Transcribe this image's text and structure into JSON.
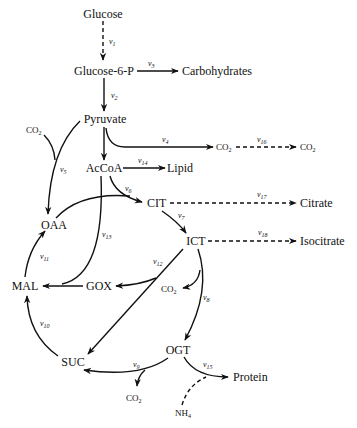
{
  "diagram": {
    "type": "metabolic-pathway",
    "nodes": {
      "glucose": "Glucose",
      "g6p": "Glucose-6-P",
      "carbohydrates": "Carbohydrates",
      "pyruvate": "Pyruvate",
      "co2_left": "CO",
      "acoa": "AcCoA",
      "lipid": "Lipid",
      "co2_v4": "CO",
      "co2_v16": "CO",
      "cit": "CIT",
      "citrate": "Citrate",
      "oaa": "OAA",
      "ict": "ICT",
      "isocitrate": "Isocitrate",
      "mal": "MAL",
      "gox": "GOX",
      "co2_ict": "CO",
      "suc": "SUC",
      "ogt": "OGT",
      "protein": "Protein",
      "co2_v9": "CO",
      "nh4": "NH"
    },
    "subscripts": {
      "co2": "2",
      "nh4": "4"
    },
    "fluxes": {
      "v1": "1",
      "v2": "2",
      "v3": "3",
      "v4": "4",
      "v5": "5",
      "v6": "6",
      "v7": "7",
      "v8": "8",
      "v9": "9",
      "v10": "10",
      "v11": "11",
      "v12": "12",
      "v13": "13",
      "v14": "14",
      "v15": "15",
      "v16": "16",
      "v17": "17",
      "v18": "18"
    },
    "flux_symbol": "v",
    "edges": [
      {
        "from": "Glucose",
        "to": "Glucose-6-P",
        "flux": "v1",
        "style": "dashed"
      },
      {
        "from": "Glucose-6-P",
        "to": "Carbohydrates",
        "flux": "v3",
        "style": "solid"
      },
      {
        "from": "Glucose-6-P",
        "to": "Pyruvate",
        "flux": "v2",
        "style": "solid"
      },
      {
        "from": "Pyruvate",
        "to": "CO2",
        "flux": "v4",
        "style": "solid"
      },
      {
        "from": "CO2",
        "to": "CO2",
        "flux": "v16",
        "style": "dashed"
      },
      {
        "from": "Pyruvate",
        "to": "AcCoA",
        "flux": "",
        "style": "solid"
      },
      {
        "from": "Pyruvate+CO2",
        "to": "OAA",
        "flux": "v5",
        "style": "solid"
      },
      {
        "from": "AcCoA",
        "to": "Lipid",
        "flux": "v14",
        "style": "solid"
      },
      {
        "from": "AcCoA+OAA",
        "to": "CIT",
        "flux": "v6",
        "style": "solid"
      },
      {
        "from": "AcCoA",
        "to": "MAL",
        "flux": "v13",
        "style": "solid"
      },
      {
        "from": "CIT",
        "to": "Citrate",
        "flux": "v17",
        "style": "dashed"
      },
      {
        "from": "CIT",
        "to": "ICT",
        "flux": "v7",
        "style": "solid"
      },
      {
        "from": "ICT",
        "to": "Isocitrate",
        "flux": "v18",
        "style": "dashed"
      },
      {
        "from": "ICT",
        "to": "GOX+SUC",
        "flux": "v12",
        "style": "solid"
      },
      {
        "from": "ICT",
        "to": "OGT+CO2",
        "flux": "v8",
        "style": "solid"
      },
      {
        "from": "GOX",
        "to": "MAL",
        "flux": "",
        "style": "solid"
      },
      {
        "from": "OGT",
        "to": "SUC+CO2",
        "flux": "v9",
        "style": "solid"
      },
      {
        "from": "OGT+NH4",
        "to": "Protein",
        "flux": "v15",
        "style": "solid"
      },
      {
        "from": "SUC",
        "to": "MAL",
        "flux": "v10",
        "style": "solid"
      },
      {
        "from": "MAL",
        "to": "OAA",
        "flux": "v11",
        "style": "solid"
      }
    ]
  }
}
